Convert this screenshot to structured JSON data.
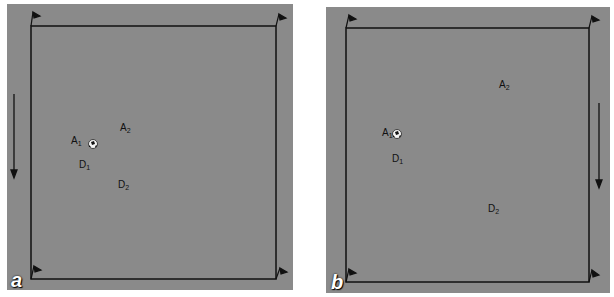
{
  "figure": {
    "panels": [
      {
        "letter": "a",
        "labels": {
          "A1": {
            "main": "A",
            "sub": "1"
          },
          "A2": {
            "main": "A",
            "sub": "2"
          },
          "D1": {
            "main": "D",
            "sub": "1"
          },
          "D2": {
            "main": "D",
            "sub": "2"
          }
        },
        "arrow_side": "left",
        "arrow_direction": "down"
      },
      {
        "letter": "b",
        "labels": {
          "A1": {
            "main": "A",
            "sub": "1"
          },
          "A2": {
            "main": "A",
            "sub": "2"
          },
          "D1": {
            "main": "D",
            "sub": "1"
          },
          "D2": {
            "main": "D",
            "sub": "2"
          }
        },
        "arrow_side": "right",
        "arrow_direction": "down"
      }
    ],
    "colors": {
      "field": "#8a8a8a",
      "lines": "#111111",
      "letter": "#ffffff"
    }
  }
}
